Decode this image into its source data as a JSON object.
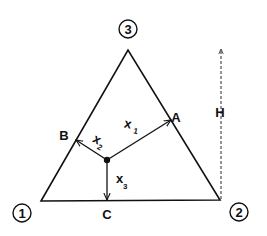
{
  "diagram": {
    "vertices": [
      {
        "id": "1",
        "label": "1"
      },
      {
        "id": "2",
        "label": "2"
      },
      {
        "id": "3",
        "label": "3"
      }
    ],
    "points": {
      "A": "A",
      "B": "B",
      "C": "C"
    },
    "distances": {
      "x1": {
        "base": "x",
        "sub": "1"
      },
      "x2": {
        "base": "x",
        "sub": "2"
      },
      "x3": {
        "base": "x",
        "sub": "3"
      }
    },
    "height_label": "H",
    "colors": {
      "stroke": "#111111",
      "background": "#ffffff"
    }
  }
}
